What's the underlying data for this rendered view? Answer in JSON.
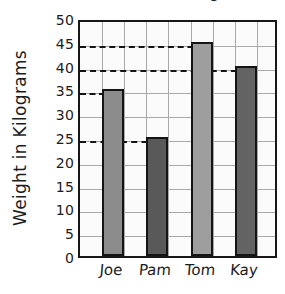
{
  "chart_data": {
    "type": "bar",
    "title": "g",
    "title_note": "title cropped off at top edge of screenshot; only a descender is visible",
    "xlabel": "",
    "ylabel": "Weight in Kilograms",
    "categories": [
      "Joe",
      "Pam",
      "Tom",
      "Kay"
    ],
    "values": [
      35,
      25,
      45,
      40
    ],
    "ylim": [
      0,
      50
    ],
    "ytick_step": 5,
    "yticks": [
      0,
      5,
      10,
      15,
      20,
      25,
      30,
      35,
      40,
      45,
      50
    ],
    "ytick_labels": [
      "0",
      "5",
      "10",
      "15",
      "20",
      "25",
      "30",
      "35",
      "40",
      "45",
      "50"
    ],
    "grid": true,
    "legend": false,
    "legend_position": "none",
    "bar_colors": [
      "#8c8c8c",
      "#595959",
      "#9e9e9e",
      "#636363"
    ],
    "dashed_guides": [
      35,
      25,
      45,
      40
    ],
    "style": "hand-drawn graph paper"
  },
  "axes": {
    "y_title": "Weight in Kilograms",
    "frame_color": "#171717",
    "grid_color": "#a9a9a9",
    "plot_background": "#fbfbfb"
  }
}
